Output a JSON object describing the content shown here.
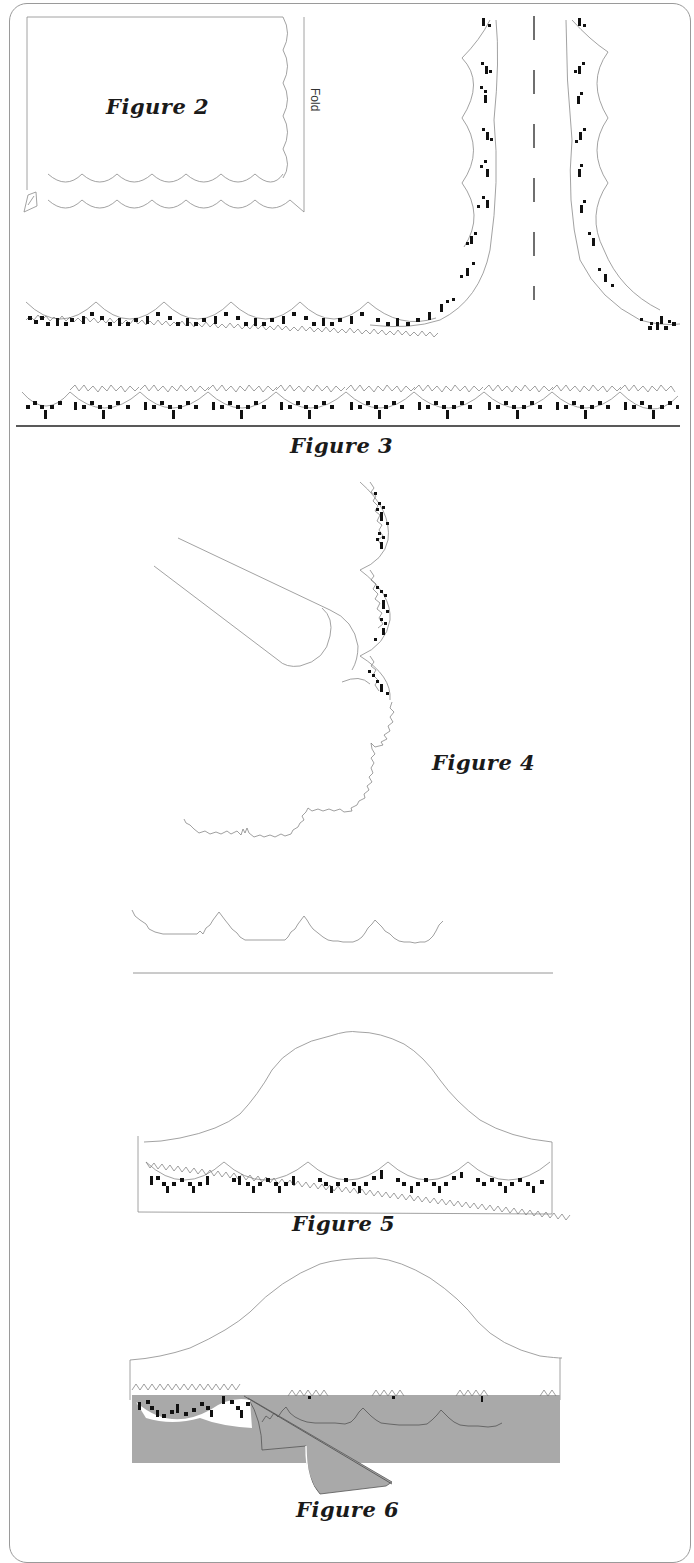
{
  "document": {
    "type": "sewing/knitting pattern instruction sheet",
    "figures": [
      {
        "id": "figure-2",
        "label": "Figure 2",
        "side_label": "Fold",
        "description": "Rectangular panel with scalloped right edge and two scalloped rows along bottom, fold line at right"
      },
      {
        "id": "figure-3",
        "label": "Figure 3",
        "description": "Scalloped trim with checker motif forming a corner and vertical edges on either side of a dashed center line, plus horizontal trim strip"
      },
      {
        "id": "figure-4",
        "label": "Figure 4",
        "description": "Scissors cutting around scalloped trim edge; cut zigzag outline remains below"
      },
      {
        "id": "figure-5",
        "label": "Figure 5",
        "description": "Bell/hat-shaped piece with scalloped trim applied along the bottom band"
      },
      {
        "id": "figure-6",
        "label": "Figure 6",
        "description": "Bell-shaped piece with trim partially covered by gray shaded fabric being folded back"
      }
    ]
  },
  "colors": {
    "background": "#ffffff",
    "border": "#9a9a9a",
    "line": "#8a8a8a",
    "motif": "#111111",
    "fabric_gray": "#a9a9a9",
    "text": "#1a1a1a"
  }
}
